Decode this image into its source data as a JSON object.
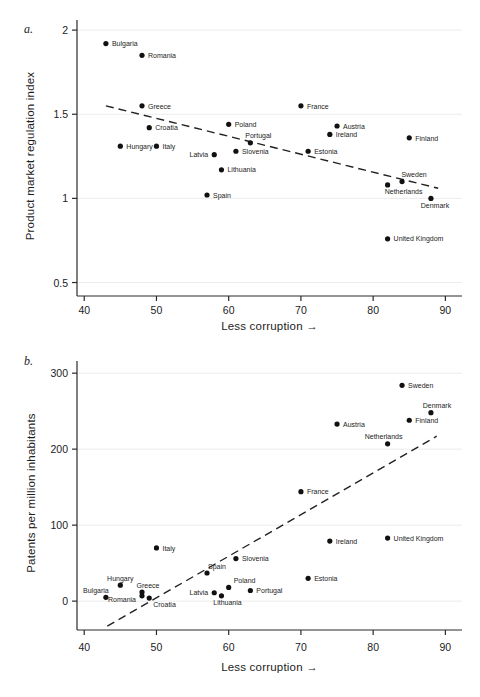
{
  "figure": {
    "background": "#ffffff",
    "text_color": "#1c1c1c",
    "marker_color": "#111111",
    "panels": [
      {
        "tag": "a.",
        "y_axis_label": "Product market regulation index",
        "x_axis_label": "Less corruption →"
      },
      {
        "tag": "b.",
        "y_axis_label": "Patents per million inhabitants",
        "x_axis_label": "Less corruption →"
      }
    ]
  },
  "chart_data": [
    {
      "type": "scatter",
      "panel": "a",
      "title": "",
      "xlabel": "Less corruption →",
      "ylabel": "Product market regulation index",
      "xlim": [
        39,
        92.3
      ],
      "ylim": [
        0.42,
        2.06
      ],
      "x_ticks": [
        40,
        50,
        60,
        70,
        80,
        90
      ],
      "y_ticks": [
        0.5,
        1,
        1.5,
        2
      ],
      "y_tick_labels": [
        "0.5",
        "1",
        "1.5",
        "2"
      ],
      "grid": "faint-horizontal",
      "legend": "none",
      "trend_line": {
        "style": "dashed",
        "x1": 43,
        "y1": 1.55,
        "x2": 89,
        "y2": 1.06
      },
      "points": [
        {
          "name": "Bulgaria",
          "x": 43,
          "y": 1.92,
          "label_pos": "right"
        },
        {
          "name": "Romania",
          "x": 48,
          "y": 1.85,
          "label_pos": "right"
        },
        {
          "name": "Greece",
          "x": 48,
          "y": 1.55,
          "label_pos": "right"
        },
        {
          "name": "Croatia",
          "x": 49,
          "y": 1.42,
          "label_pos": "right"
        },
        {
          "name": "Hungary",
          "x": 45,
          "y": 1.31,
          "label_pos": "right"
        },
        {
          "name": "Italy",
          "x": 50,
          "y": 1.31,
          "label_pos": "right"
        },
        {
          "name": "Latvia",
          "x": 58,
          "y": 1.26,
          "label_pos": "left"
        },
        {
          "name": "Poland",
          "x": 60,
          "y": 1.44,
          "label_pos": "right"
        },
        {
          "name": "Portugal",
          "x": 63,
          "y": 1.33,
          "label_pos": "above",
          "label_dx": 8
        },
        {
          "name": "Slovenia",
          "x": 61,
          "y": 1.28,
          "label_pos": "right"
        },
        {
          "name": "Lithuania",
          "x": 59,
          "y": 1.17,
          "label_pos": "right"
        },
        {
          "name": "Spain",
          "x": 57,
          "y": 1.02,
          "label_pos": "right"
        },
        {
          "name": "France",
          "x": 70,
          "y": 1.55,
          "label_pos": "right"
        },
        {
          "name": "Austria",
          "x": 75,
          "y": 1.43,
          "label_pos": "right"
        },
        {
          "name": "Ireland",
          "x": 74,
          "y": 1.38,
          "label_pos": "right"
        },
        {
          "name": "Estonia",
          "x": 71,
          "y": 1.28,
          "label_pos": "right"
        },
        {
          "name": "Finland",
          "x": 85,
          "y": 1.36,
          "label_pos": "right"
        },
        {
          "name": "Sweden",
          "x": 84,
          "y": 1.1,
          "label_pos": "above",
          "label_dx": 12
        },
        {
          "name": "Netherlands",
          "x": 82,
          "y": 1.08,
          "label_pos": "below",
          "label_dx": 16
        },
        {
          "name": "Denmark",
          "x": 88,
          "y": 1.0,
          "label_pos": "below",
          "label_dx": 4
        },
        {
          "name": "United Kingdom",
          "x": 82,
          "y": 0.76,
          "label_pos": "right"
        }
      ]
    },
    {
      "type": "scatter",
      "panel": "b",
      "title": "",
      "xlabel": "Less corruption →",
      "ylabel": "Patents per million inhabitants",
      "xlim": [
        39,
        92.3
      ],
      "ylim": [
        -38,
        316
      ],
      "x_ticks": [
        40,
        50,
        60,
        70,
        80,
        90
      ],
      "y_ticks": [
        0,
        100,
        200,
        300
      ],
      "y_tick_labels": [
        "0",
        "100",
        "200",
        "300"
      ],
      "grid": "faint-horizontal",
      "legend": "none",
      "trend_line": {
        "style": "dashed",
        "x1": 43.2,
        "y1": -33,
        "x2": 88.8,
        "y2": 217
      },
      "points": [
        {
          "name": "Sweden",
          "x": 84,
          "y": 284,
          "label_pos": "right"
        },
        {
          "name": "Denmark",
          "x": 88,
          "y": 248,
          "label_pos": "above",
          "label_dx": 6
        },
        {
          "name": "Finland",
          "x": 85,
          "y": 238,
          "label_pos": "right"
        },
        {
          "name": "Austria",
          "x": 75,
          "y": 233,
          "label_pos": "right"
        },
        {
          "name": "Netherlands",
          "x": 82,
          "y": 207,
          "label_pos": "above",
          "label_dx": -4
        },
        {
          "name": "France",
          "x": 70,
          "y": 144,
          "label_pos": "right"
        },
        {
          "name": "United Kingdom",
          "x": 82,
          "y": 83,
          "label_pos": "right"
        },
        {
          "name": "Ireland",
          "x": 74,
          "y": 79,
          "label_pos": "right"
        },
        {
          "name": "Italy",
          "x": 50,
          "y": 70,
          "label_pos": "right"
        },
        {
          "name": "Slovenia",
          "x": 61,
          "y": 56,
          "label_pos": "right"
        },
        {
          "name": "Spain",
          "x": 57,
          "y": 37,
          "label_pos": "above-right",
          "label_dx": -2
        },
        {
          "name": "Estonia",
          "x": 71,
          "y": 30,
          "label_pos": "right"
        },
        {
          "name": "Hungary",
          "x": 45,
          "y": 21,
          "label_pos": "above"
        },
        {
          "name": "Poland",
          "x": 60,
          "y": 18,
          "label_pos": "above-right",
          "label_dx": 2
        },
        {
          "name": "Portugal",
          "x": 63,
          "y": 14,
          "label_pos": "right"
        },
        {
          "name": "Greece",
          "x": 48,
          "y": 12,
          "label_pos": "above",
          "label_dx": 6
        },
        {
          "name": "Latvia",
          "x": 58,
          "y": 11,
          "label_pos": "left"
        },
        {
          "name": "Lithuania",
          "x": 59,
          "y": 7,
          "label_pos": "below",
          "label_dx": 6
        },
        {
          "name": "Romania",
          "x": 48,
          "y": 7,
          "label_pos": "left",
          "label_dy": 3
        },
        {
          "name": "Bulgaria",
          "x": 43,
          "y": 5,
          "label_pos": "above",
          "label_dx": -10
        },
        {
          "name": "Croatia",
          "x": 49,
          "y": 4,
          "label_pos": "below-right"
        }
      ]
    }
  ]
}
